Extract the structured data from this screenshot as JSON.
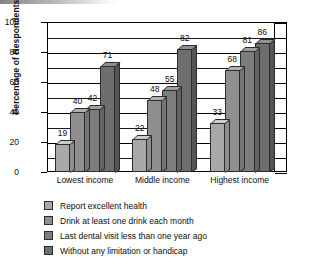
{
  "chart_data": {
    "type": "bar",
    "title": "",
    "subtitle": "",
    "xlabel": "",
    "ylabel": "Percentage of Respondents",
    "categories": [
      "Lowest income",
      "Middle income",
      "Highest income"
    ],
    "series": [
      {
        "name": "Report excellent health",
        "values": [
          19,
          22,
          33
        ],
        "color": "#a8a8a8"
      },
      {
        "name": "Drink at least one drink each month",
        "values": [
          40,
          48,
          68
        ],
        "color": "#8f8f8f"
      },
      {
        "name": "Last dental visit less than one year ago",
        "values": [
          42,
          55,
          81
        ],
        "color": "#7d7d7d"
      },
      {
        "name": "Without any limitation or handicap",
        "values": [
          71,
          82,
          86
        ],
        "color": "#6e6e6e"
      }
    ],
    "ylim": [
      0,
      100
    ],
    "y_ticks": [
      0,
      20,
      40,
      60,
      80,
      100
    ],
    "y_minor_step": 10,
    "grid": true,
    "legend_position": "bottom-left",
    "bar_style": "3d-grouped",
    "data_labels": true
  },
  "axes": {
    "y_tick_labels": [
      "0",
      "20",
      "40",
      "60",
      "80",
      "100"
    ],
    "y_title": "Percentage of Respondents"
  },
  "legend": {
    "items": [
      {
        "label": "Report excellent health"
      },
      {
        "label": "Drink at least one drink each month"
      },
      {
        "label": "Last dental visit less than one year ago"
      },
      {
        "label": "Without any limitation or handicap"
      }
    ]
  }
}
